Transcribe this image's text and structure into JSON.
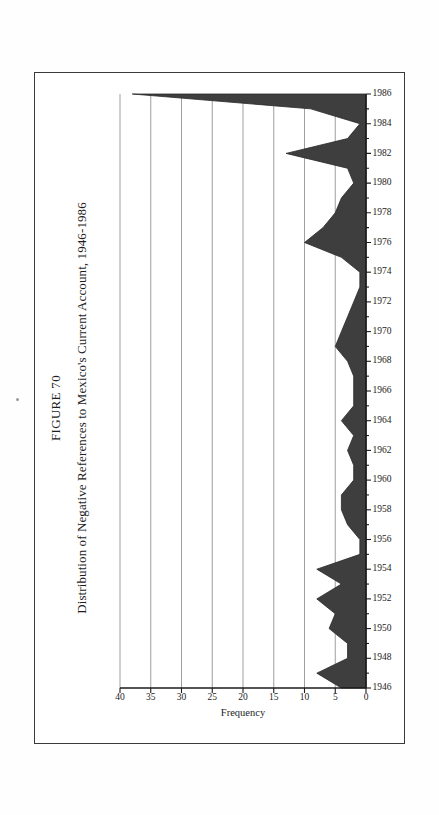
{
  "page": {
    "background_color": "#ffffff",
    "border_color": "#3a3a3a"
  },
  "figure": {
    "number_label": "FIGURE 70",
    "title": "Distribution of Negative References to Mexico's Current Account, 1946-1986"
  },
  "chart_data": {
    "type": "area",
    "title": "Distribution of Negative References to Mexico's Current Account, 1946-1986",
    "subtitle": "FIGURE 70",
    "xlabel": "",
    "ylabel": "Frequency",
    "ylim": [
      0,
      40
    ],
    "xlim": [
      1946,
      1986
    ],
    "grid": true,
    "legend": "none",
    "orientation": "rotated-90-ccw-on-page",
    "fill_color": "#3e3e3e",
    "y_ticks": [
      0,
      5,
      10,
      15,
      20,
      25,
      30,
      35,
      40
    ],
    "y_tick_labels": [
      "0",
      "5",
      "10",
      "15",
      "20",
      "25",
      "30",
      "35",
      "40"
    ],
    "x_tick_labels": [
      "1946",
      "1948",
      "1950",
      "1952",
      "1954",
      "1956",
      "1958",
      "1960",
      "1962",
      "1964",
      "1966",
      "1968",
      "1970",
      "1972",
      "1974",
      "1976",
      "1978",
      "1980",
      "1982",
      "1984",
      "1986"
    ],
    "x": [
      1946,
      1947,
      1948,
      1949,
      1950,
      1951,
      1952,
      1953,
      1954,
      1955,
      1956,
      1957,
      1958,
      1959,
      1960,
      1961,
      1962,
      1963,
      1964,
      1965,
      1966,
      1967,
      1968,
      1969,
      1970,
      1971,
      1972,
      1973,
      1974,
      1975,
      1976,
      1977,
      1978,
      1979,
      1980,
      1981,
      1982,
      1983,
      1984,
      1985,
      1986
    ],
    "values": [
      4,
      8,
      3,
      3,
      6,
      5,
      8,
      4,
      8,
      1,
      1,
      3,
      4,
      4,
      2,
      2,
      3,
      2,
      4,
      2,
      2,
      2,
      3,
      5,
      4,
      3,
      2,
      1,
      1,
      4,
      10,
      7,
      5,
      4,
      2,
      3,
      13,
      3,
      1,
      9,
      38
    ]
  },
  "axis": {
    "y_title": "Frequency"
  }
}
